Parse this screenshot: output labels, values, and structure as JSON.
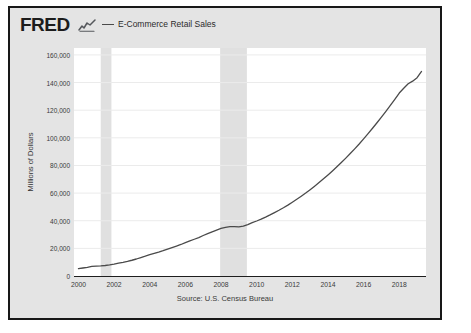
{
  "brand": {
    "logo_text": "FRED",
    "logo_mark": "squiggle-chart-icon"
  },
  "legend": {
    "marker": "line-marker",
    "label": "E-Commerce Retail Sales",
    "color": "#4a4a4a"
  },
  "source_note": "Source: U.S. Census Bureau",
  "colors": {
    "line": "#4a4a4a",
    "figure_background": "#e4e4e4",
    "plot_background": "#ffffff",
    "gridline": "#ebebeb",
    "recession_band": "#e0e0e0",
    "border": "#181818",
    "text": "#3a3a3a"
  },
  "chart_data": {
    "type": "line",
    "title": "",
    "xlabel": "",
    "ylabel": "Millions of Dollars",
    "xlim": [
      1999.75,
      2019.5
    ],
    "ylim": [
      0,
      165000
    ],
    "grid": true,
    "legend_position": "top",
    "ytick_labels": [
      "160,000",
      "140,000",
      "120,000",
      "100,000",
      "80,000",
      "60,000",
      "40,000",
      "20,000",
      "0"
    ],
    "ytick_values": [
      160000,
      140000,
      120000,
      100000,
      80000,
      60000,
      40000,
      20000,
      0
    ],
    "xtick_labels": [
      "2000",
      "2002",
      "2004",
      "2006",
      "2008",
      "2010",
      "2012",
      "2014",
      "2016",
      "2018"
    ],
    "xtick_values": [
      2000,
      2002,
      2004,
      2006,
      2008,
      2010,
      2012,
      2014,
      2016,
      2018
    ],
    "recession_bands": [
      {
        "start": 2001.25,
        "end": 2001.85
      },
      {
        "start": 2007.95,
        "end": 2009.45
      }
    ],
    "series": [
      {
        "name": "E-Commerce Retail Sales",
        "x": [
          2000.0,
          2000.25,
          2000.5,
          2000.75,
          2001.0,
          2001.25,
          2001.5,
          2001.75,
          2002.0,
          2002.25,
          2002.5,
          2002.75,
          2003.0,
          2003.25,
          2003.5,
          2003.75,
          2004.0,
          2004.25,
          2004.5,
          2004.75,
          2005.0,
          2005.25,
          2005.5,
          2005.75,
          2006.0,
          2006.25,
          2006.5,
          2006.75,
          2007.0,
          2007.25,
          2007.5,
          2007.75,
          2008.0,
          2008.25,
          2008.5,
          2008.75,
          2009.0,
          2009.25,
          2009.5,
          2009.75,
          2010.0,
          2010.25,
          2010.5,
          2010.75,
          2011.0,
          2011.25,
          2011.5,
          2011.75,
          2012.0,
          2012.25,
          2012.5,
          2012.75,
          2013.0,
          2013.25,
          2013.5,
          2013.75,
          2014.0,
          2014.25,
          2014.5,
          2014.75,
          2015.0,
          2015.25,
          2015.5,
          2015.75,
          2016.0,
          2016.25,
          2016.5,
          2016.75,
          2017.0,
          2017.25,
          2017.5,
          2017.75,
          2018.0,
          2018.25,
          2018.5,
          2018.75,
          2019.0,
          2019.25
        ],
        "values": [
          5300,
          5800,
          6300,
          6900,
          7100,
          7300,
          7600,
          8000,
          8600,
          9300,
          9900,
          10600,
          11400,
          12300,
          13300,
          14300,
          15400,
          16400,
          17300,
          18300,
          19500,
          20600,
          21700,
          22800,
          24100,
          25400,
          26600,
          27800,
          29300,
          30700,
          32000,
          33200,
          34400,
          35200,
          35700,
          35800,
          35600,
          36100,
          37200,
          38600,
          39800,
          41100,
          42600,
          44200,
          45900,
          47600,
          49400,
          51300,
          53400,
          55500,
          57700,
          60000,
          62500,
          65000,
          67600,
          70300,
          73100,
          76000,
          79000,
          82100,
          85300,
          88600,
          92000,
          95500,
          99200,
          103000,
          106900,
          110900,
          115000,
          119200,
          123500,
          127900,
          132400,
          135900,
          139100,
          141000,
          143500,
          148000
        ]
      }
    ]
  }
}
